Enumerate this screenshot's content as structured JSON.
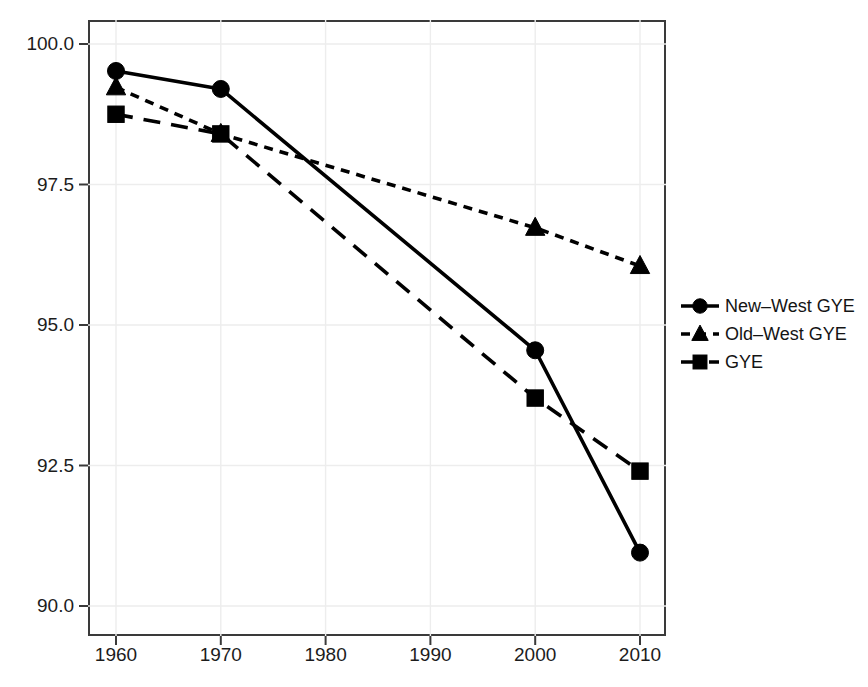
{
  "chart_data": {
    "type": "line",
    "title": "",
    "subtitle": "",
    "xlabel": "",
    "ylabel": "",
    "x": [
      1960,
      1970,
      1980,
      1990,
      2000,
      2010
    ],
    "xticklabels": [
      "1960",
      "1970",
      "1980",
      "1990",
      "2000",
      "2010"
    ],
    "yticklabels": [
      "100.0",
      "97.5",
      "95.0",
      "92.5",
      "90.0"
    ],
    "yticks": [
      100.0,
      97.5,
      95.0,
      92.5,
      90.0
    ],
    "xlim": [
      1955,
      2015
    ],
    "ylim": [
      89.0,
      101.1
    ],
    "grid": true,
    "legend_position": "right",
    "series": [
      {
        "name": "New–West GYE",
        "marker": "circle",
        "linestyle": "solid",
        "color": "#000000",
        "x": [
          1960,
          1970,
          2000,
          2010
        ],
        "values": [
          99.52,
          99.2,
          94.55,
          90.95
        ]
      },
      {
        "name": "Old–West GYE",
        "marker": "triangle",
        "linestyle": "dotted",
        "color": "#000000",
        "x": [
          1960,
          1970,
          2000,
          2010
        ],
        "values": [
          99.23,
          98.4,
          96.73,
          96.05
        ]
      },
      {
        "name": "GYE",
        "marker": "square",
        "linestyle": "dashed",
        "color": "#000000",
        "x": [
          1960,
          1970,
          2000,
          2010
        ],
        "values": [
          98.75,
          98.4,
          93.7,
          92.4
        ]
      }
    ]
  },
  "legend": {
    "items": [
      {
        "label": "New–West GYE",
        "marker": "circle",
        "linestyle": "solid"
      },
      {
        "label": "Old–West GYE",
        "marker": "triangle",
        "linestyle": "dotted"
      },
      {
        "label": "GYE",
        "marker": "square",
        "linestyle": "dashed"
      }
    ]
  },
  "colors": {
    "axis": "#3a3a3a",
    "grid": "#ededed",
    "series": "#000000",
    "text": "#1c1c1c",
    "background": "#ffffff"
  }
}
